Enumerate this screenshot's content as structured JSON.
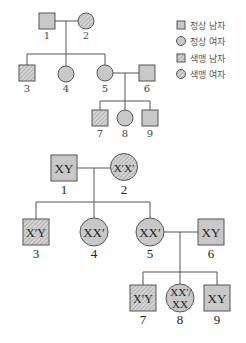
{
  "legend": {
    "items": [
      {
        "shape": "square",
        "pattern": "solid",
        "label": "정상 남자"
      },
      {
        "shape": "circle",
        "pattern": "solid",
        "label": "정상 여자"
      },
      {
        "shape": "square",
        "pattern": "hatched",
        "label": "색맹 남자"
      },
      {
        "shape": "circle",
        "pattern": "hatched",
        "label": "색맹 여자"
      }
    ]
  },
  "colors": {
    "fill": "#c8c8c8",
    "stroke": "#555555",
    "hatch": "#9a9a9a",
    "line": "#555555"
  },
  "pedigree_top": {
    "nodes": [
      {
        "id": "1",
        "label": "1",
        "sex": "male",
        "phenotype": "정상"
      },
      {
        "id": "2",
        "label": "2",
        "sex": "female",
        "phenotype": "색맹"
      },
      {
        "id": "3",
        "label": "3",
        "sex": "male",
        "phenotype": "색맹"
      },
      {
        "id": "4",
        "label": "4",
        "sex": "female",
        "phenotype": "정상"
      },
      {
        "id": "5",
        "label": "5",
        "sex": "female",
        "phenotype": "정상"
      },
      {
        "id": "6",
        "label": "6",
        "sex": "male",
        "phenotype": "정상"
      },
      {
        "id": "7",
        "label": "7",
        "sex": "male",
        "phenotype": "색맹"
      },
      {
        "id": "8",
        "label": "8",
        "sex": "female",
        "phenotype": "정상"
      },
      {
        "id": "9",
        "label": "9",
        "sex": "male",
        "phenotype": "정상"
      }
    ]
  },
  "pedigree_bottom": {
    "nodes": [
      {
        "id": "1",
        "label": "1",
        "genotype": "XY"
      },
      {
        "id": "2",
        "label": "2",
        "genotype": "X′X′"
      },
      {
        "id": "3",
        "label": "3",
        "genotype": "X′Y"
      },
      {
        "id": "4",
        "label": "4",
        "genotype": "XX′"
      },
      {
        "id": "5",
        "label": "5",
        "genotype": "XX′"
      },
      {
        "id": "6",
        "label": "6",
        "genotype": "XY"
      },
      {
        "id": "7",
        "label": "7",
        "genotype": "X′Y"
      },
      {
        "id": "8",
        "label": "8",
        "genotype_line1": "XX′/",
        "genotype_line2": "XX"
      },
      {
        "id": "9",
        "label": "9",
        "genotype": "XY"
      }
    ]
  }
}
